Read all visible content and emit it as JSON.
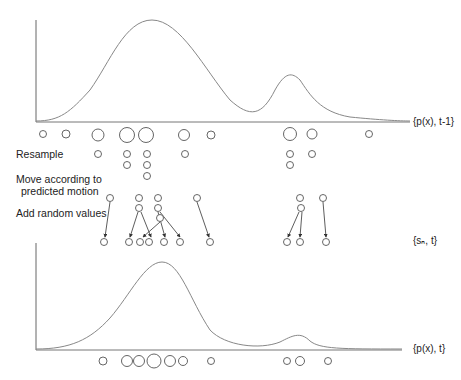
{
  "diagram": {
    "type": "particle-filter-condensation",
    "labels": {
      "prior": "{p(x), t-1}",
      "resample": "Resample",
      "move": "Move according to",
      "move2": "predicted motion",
      "random": "Add random values",
      "samples": "{sₙ, t}",
      "posterior": "{p(x), t}"
    },
    "colors": {
      "curve": "#888888",
      "axis": "#666666",
      "particle": "#555555",
      "arrow": "#333333"
    },
    "top_curve": {
      "path": "M36,121 C60,121 70,112 90,90 C110,62 125,20 152,20 C180,20 205,70 230,100 C250,118 262,116 275,90 C285,72 292,72 300,80 C310,95 320,112 350,117 C380,120 400,121 410,121"
    },
    "bottom_curve": {
      "path": "M36,349 C70,349 90,340 110,318 C130,295 145,262 162,262 C180,262 190,300 210,330 C225,346 260,350 280,342 C292,336 300,331 310,341 C320,349 340,349 402,349"
    },
    "rows": {
      "prior_particles": [
        [
          43,
          134,
          3.5
        ],
        [
          66,
          134,
          4
        ],
        [
          98,
          135,
          6
        ],
        [
          127,
          135,
          7.5
        ],
        [
          146,
          135,
          7.5
        ],
        [
          184,
          135,
          5.5
        ],
        [
          211,
          135,
          4
        ],
        [
          290,
          134,
          6.5
        ],
        [
          312,
          134,
          5
        ],
        [
          369,
          134,
          3.5
        ]
      ],
      "resample_particles": [
        [
          98,
          154,
          3.5
        ],
        [
          127,
          154,
          3.5
        ],
        [
          147,
          154,
          3.5
        ],
        [
          185,
          154,
          3.5
        ],
        [
          290,
          154,
          3.5
        ],
        [
          312,
          154,
          3.5
        ],
        [
          127,
          165,
          3.5
        ],
        [
          147,
          165,
          3.5
        ],
        [
          290,
          165,
          3.5
        ],
        [
          147,
          176,
          3.5
        ]
      ],
      "moved_particles": [
        [
          110,
          198,
          3.5
        ],
        [
          139,
          198,
          3.5
        ],
        [
          158,
          198,
          3.5
        ],
        [
          197,
          198,
          3.5
        ],
        [
          300,
          198,
          3.5
        ],
        [
          323,
          198,
          3.5
        ],
        [
          139,
          208,
          3.5
        ],
        [
          158,
          208,
          3.5
        ],
        [
          301,
          208,
          3.5
        ],
        [
          160,
          218,
          3.5
        ]
      ],
      "diffused_particles": [
        [
          104,
          242,
          3.5
        ],
        [
          129,
          242,
          3.5
        ],
        [
          140,
          242,
          3.5
        ],
        [
          149,
          242,
          3.5
        ],
        [
          164,
          242,
          3.5
        ],
        [
          180,
          242,
          3.5
        ],
        [
          210,
          242,
          3.5
        ],
        [
          287,
          242,
          3.5
        ],
        [
          300,
          242,
          3.5
        ],
        [
          326,
          242,
          3.5
        ]
      ],
      "posterior_particles": [
        [
          103,
          361,
          4
        ],
        [
          127,
          361,
          5.5
        ],
        [
          139,
          361,
          5.5
        ],
        [
          154,
          361,
          7
        ],
        [
          170,
          361,
          5.5
        ],
        [
          183,
          361,
          4.5
        ],
        [
          211,
          361,
          3.5
        ],
        [
          287,
          361,
          3.5
        ],
        [
          300,
          361,
          4.5
        ],
        [
          328,
          361,
          3.5
        ]
      ]
    },
    "arrows": [
      [
        110,
        202,
        105,
        237
      ],
      [
        138,
        212,
        130,
        237
      ],
      [
        141,
        212,
        151,
        237
      ],
      [
        158,
        212,
        165,
        237
      ],
      [
        160,
        212,
        180,
        237
      ],
      [
        160,
        222,
        143,
        237
      ],
      [
        197,
        202,
        209,
        237
      ],
      [
        299,
        212,
        288,
        237
      ],
      [
        302,
        212,
        300,
        237
      ],
      [
        323,
        202,
        326,
        237
      ]
    ]
  }
}
